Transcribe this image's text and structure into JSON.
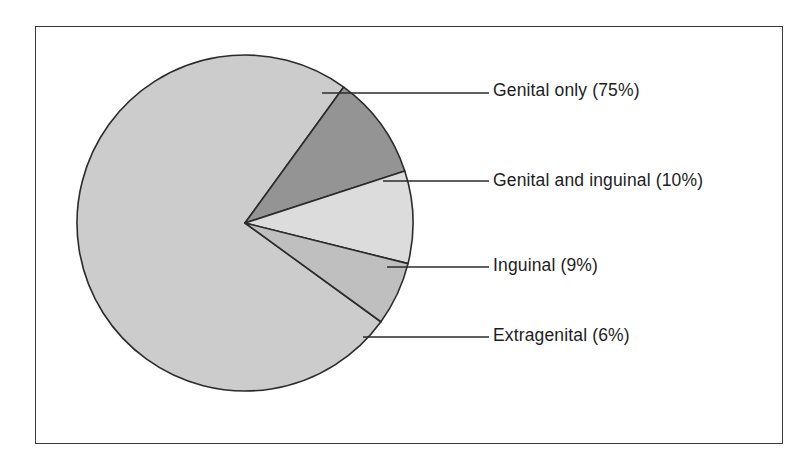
{
  "figure": {
    "frame_color": "#3a3a3a",
    "background": "#ffffff"
  },
  "chart_data": {
    "type": "pie",
    "title": "",
    "subtitle": "",
    "xlabel": "",
    "ylabel": "",
    "legend_position": "right-leader-labels",
    "grid": false,
    "total_percent": 100,
    "units": "%",
    "categories": [
      "Genital only",
      "Genital and inguinal",
      "Inguinal",
      "Extragenital"
    ],
    "values": [
      75,
      10,
      9,
      6
    ],
    "colors": [
      "#cccccc",
      "#949494",
      "#dcdcdc",
      "#bfbfbf"
    ],
    "slices": [
      {
        "name": "Genital only",
        "label": "Genital only (75%)",
        "value": 75,
        "color": "#cccccc",
        "start_angle_deg": 36,
        "end_angle_deg": 306
      },
      {
        "name": "Genital and inguinal",
        "label": "Genital and inguinal (10%)",
        "value": 10,
        "color": "#949494",
        "start_angle_deg": -54,
        "end_angle_deg": -18
      },
      {
        "name": "Inguinal",
        "label": "Inguinal (9%)",
        "value": 9,
        "color": "#dcdcdc",
        "start_angle_deg": -18,
        "end_angle_deg": 14
      },
      {
        "name": "Extragenital",
        "label": "Extragenital (6%)",
        "value": 6,
        "color": "#bfbfbf",
        "start_angle_deg": 14,
        "end_angle_deg": 36
      }
    ]
  },
  "labels": {
    "genital_only": "Genital only (75%)",
    "genital_and_inguinal": "Genital and inguinal (10%)",
    "inguinal": "Inguinal (9%)",
    "extragenital": "Extragenital (6%)"
  }
}
